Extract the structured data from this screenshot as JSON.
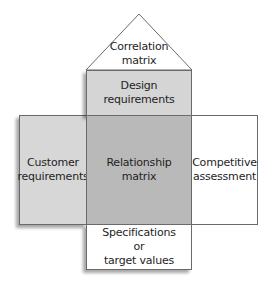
{
  "diagram": {
    "type": "House of Quality",
    "colors": {
      "design": "#d5d5d5",
      "customer": "#d7d7d7",
      "relationship": "#b9b9b9",
      "white": "#ffffff",
      "border": "#6a6a6a"
    },
    "roof": {
      "label": "Correlation\nmatrix"
    },
    "design_requirements": {
      "label": "Design\nrequirements"
    },
    "customer_requirements": {
      "label": "Customer\nrequirements"
    },
    "relationship_matrix": {
      "label": "Relationship\nmatrix"
    },
    "competitive_assessment": {
      "label": "Competitive\nassessment"
    },
    "specifications": {
      "label": "Specifications\nor\ntarget values"
    }
  }
}
